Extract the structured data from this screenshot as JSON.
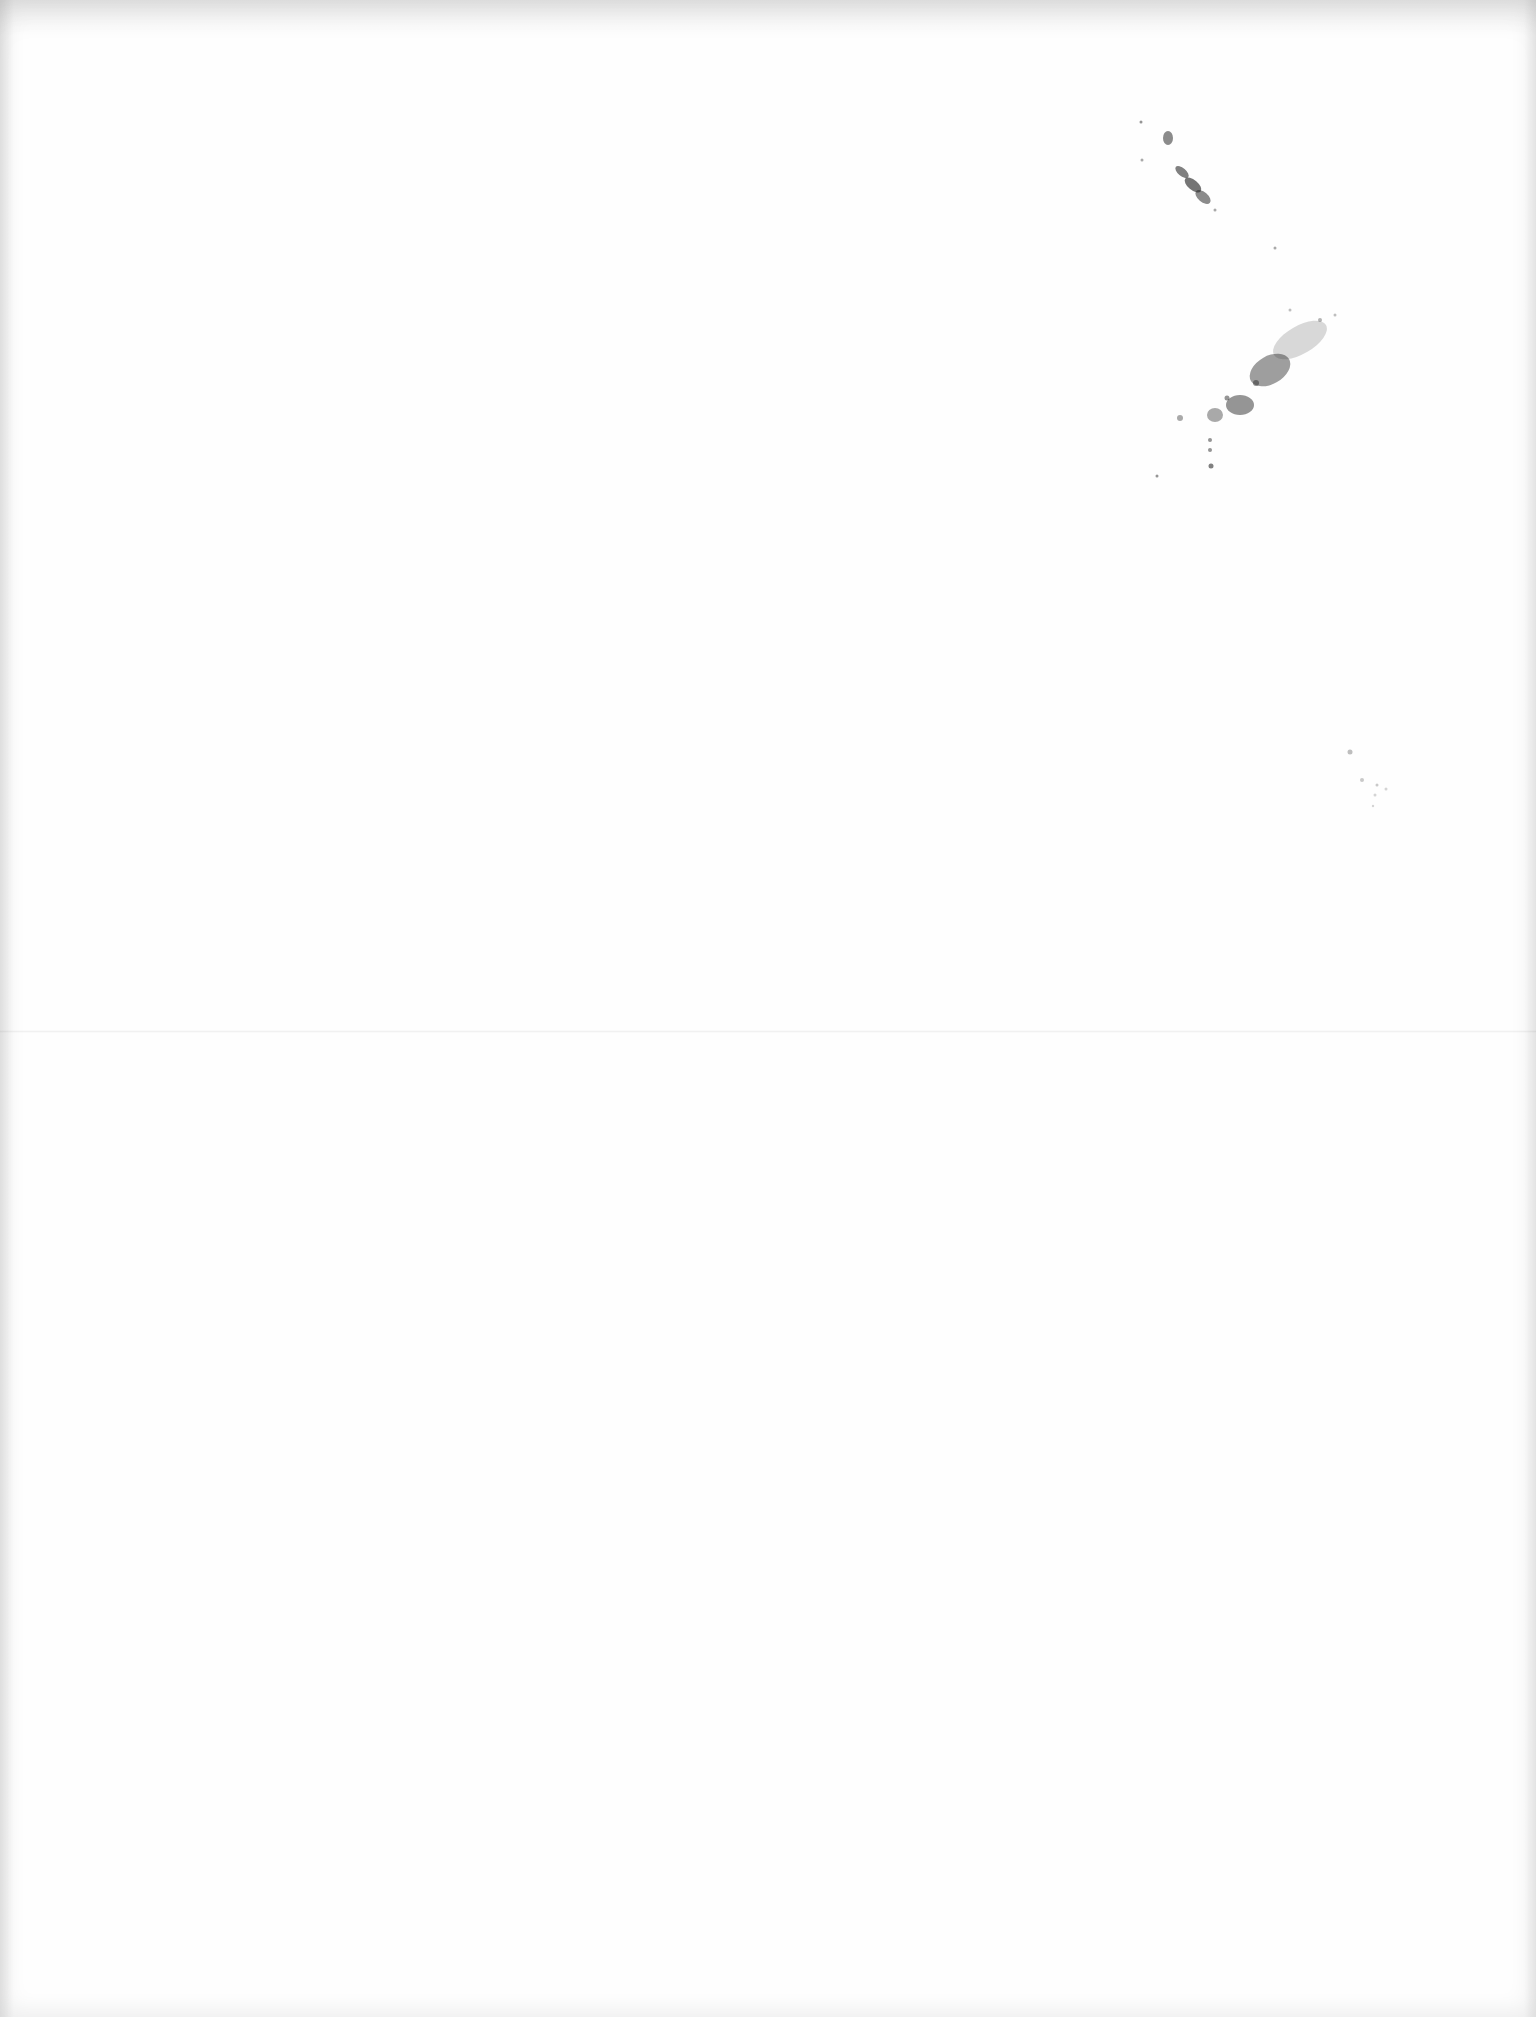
{
  "page": {
    "background_color": "#fefefe",
    "speck_color": "#2b2b2b",
    "text_content": ""
  }
}
